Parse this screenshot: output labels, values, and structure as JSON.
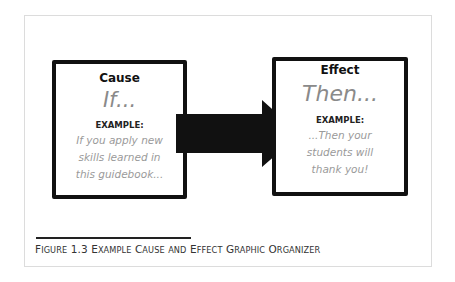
{
  "figure": {
    "cause": {
      "heading": "Cause",
      "keyword": "If...",
      "example_label": "EXAMPLE:",
      "example_lines": [
        "If you apply new",
        "skills learned in",
        "this guidebook..."
      ]
    },
    "effect": {
      "heading": "Effect",
      "keyword": "Then...",
      "example_label": "EXAMPLE:",
      "example_lines": [
        "...Then your",
        "students will",
        "thank you!"
      ]
    },
    "arrow_color": "#111111",
    "border_color": "#111111",
    "text_gray": "#8a8a8a"
  },
  "caption": {
    "prefix": "F",
    "parts": [
      {
        "cap": "F",
        "rest": "IGURE"
      },
      {
        "cap": "1.3",
        "rest": ""
      },
      {
        "cap": "E",
        "rest": "XAMPLE"
      },
      {
        "cap": "C",
        "rest": "AUSE"
      },
      {
        "cap": "",
        "rest": "AND"
      },
      {
        "cap": "E",
        "rest": "FFECT"
      },
      {
        "cap": "G",
        "rest": "RAPHIC"
      },
      {
        "cap": "O",
        "rest": "RGANIZER"
      }
    ],
    "full_text": "FIGURE 1.3 Example Cause and Effect Graphic Organizer"
  }
}
